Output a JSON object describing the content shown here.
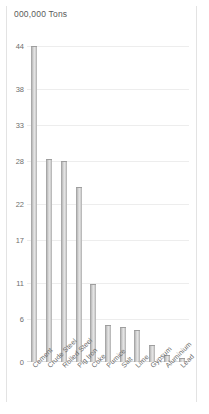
{
  "chart_data": {
    "type": "bar",
    "title": "000,000 Tons",
    "xlabel": "",
    "ylabel": "",
    "ylim": [
      0,
      44
    ],
    "grid": true,
    "legend": "none",
    "yticks": [
      44,
      38,
      33,
      28,
      22,
      17,
      11,
      6,
      0
    ],
    "categories": [
      "Cement",
      "Crude Steel",
      "Rolled Steel",
      "Pig Iron",
      "Coke",
      "Pumice",
      "Salt",
      "Lime",
      "Gypsum",
      "Aluminium",
      "Lead"
    ],
    "values": [
      44,
      28.2,
      28,
      24.3,
      10.8,
      5.2,
      4.9,
      4.5,
      2.4,
      1.0,
      0.6
    ]
  },
  "colors": {
    "bar": "#bdbdbd",
    "bar_edge": "#9e9e9e",
    "grid": "#ededed",
    "text": "#6b6b6b",
    "frame": "#e3e3e3",
    "background": "#ffffff"
  }
}
